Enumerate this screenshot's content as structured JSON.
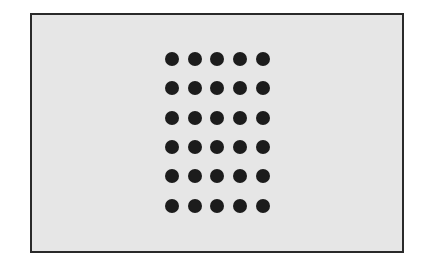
{
  "figure": {
    "frame_color": "#2a2a2a",
    "background_color": "#e6e6e6",
    "dot_color": "#1c1c1c",
    "grid": {
      "columns": 5,
      "rows": 6,
      "column_centers_x": [
        172,
        195,
        217,
        240,
        263
      ],
      "row_centers_y": [
        59,
        88,
        118,
        147,
        176,
        206
      ],
      "dot_diameter": 14
    }
  }
}
